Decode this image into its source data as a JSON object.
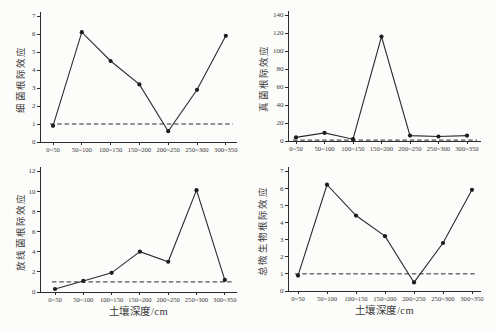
{
  "figure": {
    "background": "#fcfcfb",
    "ink_color": "#2b2b2b",
    "x_axis_title": "土壤深度/cm",
    "reference_line_style": "dashed",
    "marker_style": "filled-circle",
    "layout_note": "2x2 grid of line charts"
  },
  "chart_data": [
    {
      "type": "line",
      "id": "bacterial-rhizosphere-effect",
      "title": "",
      "ylabel": "细菌根际效应",
      "xlabel": "",
      "categories": [
        "0~50",
        "50~100",
        "100~150",
        "150~200",
        "200~250",
        "250~300",
        "300~350"
      ],
      "values": [
        0.9,
        6.1,
        4.5,
        3.2,
        0.6,
        2.9,
        5.9
      ],
      "ylim": [
        0,
        7
      ],
      "ytick_step": 1,
      "reference_line_y": 1,
      "grid": false,
      "legend": "none"
    },
    {
      "type": "line",
      "id": "fungal-rhizosphere-effect",
      "title": "",
      "ylabel": "真菌根际效应",
      "xlabel": "",
      "categories": [
        "0~50",
        "50~100",
        "100~150",
        "150~200",
        "200~250",
        "250~300",
        "300~350"
      ],
      "values": [
        4,
        9,
        2,
        116,
        6,
        5,
        6
      ],
      "ylim": [
        0,
        140
      ],
      "ytick_step": 20,
      "reference_line_y": 1,
      "grid": false,
      "legend": "none"
    },
    {
      "type": "line",
      "id": "actinomycete-rhizosphere-effect",
      "title": "",
      "ylabel": "放线菌根际效应",
      "xlabel": "土壤深度/cm",
      "categories": [
        "0~50",
        "50~100",
        "100~150",
        "150~200",
        "200~250",
        "250~300",
        "300~350"
      ],
      "values": [
        0.3,
        1.1,
        1.9,
        4.0,
        3.0,
        10.1,
        1.2
      ],
      "ylim": [
        0,
        12
      ],
      "ytick_step": 2,
      "reference_line_y": 1,
      "grid": false,
      "legend": "none"
    },
    {
      "type": "line",
      "id": "total-microbial-rhizosphere-effect",
      "title": "",
      "ylabel": "总微生物根际效应",
      "xlabel": "土壤深度/cm",
      "categories": [
        "0~50",
        "50~100",
        "100~150",
        "150~200",
        "200~250",
        "250~300",
        "300~350"
      ],
      "values": [
        0.9,
        6.2,
        4.4,
        3.2,
        0.5,
        2.8,
        5.9
      ],
      "ylim": [
        0,
        7
      ],
      "ytick_step": 1,
      "reference_line_y": 1,
      "grid": false,
      "legend": "none"
    }
  ]
}
